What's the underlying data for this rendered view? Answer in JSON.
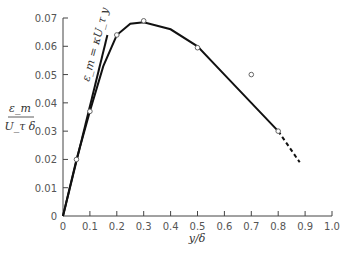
{
  "chart_data": {
    "type": "line",
    "title": "",
    "xlabel": "y/δ",
    "ylabel_num": "ε_m",
    "ylabel_den": "U_τ δ",
    "xlim": [
      0,
      1.0
    ],
    "ylim": [
      0,
      0.07
    ],
    "x_ticks": [
      "0",
      "0.1",
      "0.2",
      "0.3",
      "0.4",
      "0.5",
      "0.6",
      "0.7",
      "0.8",
      "0.9",
      "1.0"
    ],
    "y_ticks": [
      "0",
      "0.01",
      "0.02",
      "0.03",
      "0.04",
      "0.05",
      "0.06",
      "0.07"
    ],
    "grid": false,
    "annotation": "ε_m = κU_τ y",
    "points": {
      "x": [
        0.05,
        0.1,
        0.2,
        0.3,
        0.5,
        0.7,
        0.8
      ],
      "y": [
        0.02,
        0.037,
        0.064,
        0.069,
        0.0595,
        0.05,
        0.03
      ]
    },
    "series": [
      {
        "name": "fitted curve",
        "x": [
          0,
          0.05,
          0.1,
          0.15,
          0.2,
          0.25,
          0.3,
          0.4,
          0.5,
          0.6,
          0.7,
          0.8
        ],
        "y": [
          0,
          0.02,
          0.037,
          0.053,
          0.064,
          0.068,
          0.0685,
          0.066,
          0.06,
          0.05,
          0.04,
          0.03
        ]
      },
      {
        "name": "extrapolation (dashed)",
        "x": [
          0.8,
          0.88
        ],
        "y": [
          0.03,
          0.019
        ]
      },
      {
        "name": "ε_m = κU_τ y",
        "x": [
          0,
          0.165
        ],
        "y": [
          0,
          0.064
        ]
      }
    ]
  }
}
